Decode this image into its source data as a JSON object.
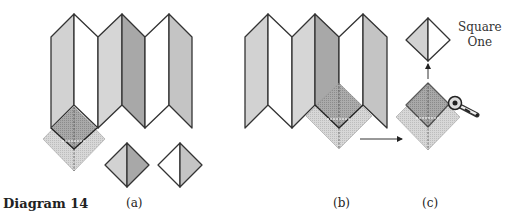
{
  "figure": {
    "title": "Diagram 14",
    "subfigures": [
      {
        "label": "(a)"
      },
      {
        "label": "(b)"
      },
      {
        "label": "(c)"
      }
    ],
    "annotation": {
      "line1": "Square",
      "line2": "One"
    }
  },
  "colors": {
    "outline": "#333333",
    "panel_light": "#d2d2d2",
    "panel_mid": "#c4c4c4",
    "panel_dark": "#a8a8a8",
    "panel_white": "#ffffff",
    "ruler_square": "#cfcfcf",
    "ruler_dark": "#8e8e8e"
  }
}
